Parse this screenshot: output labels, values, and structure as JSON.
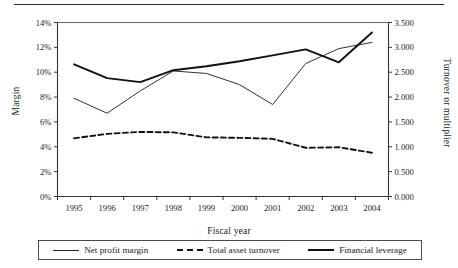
{
  "figure": {
    "top_rule": "horizontal-rule"
  },
  "chart_data": {
    "type": "line",
    "title": "",
    "xlabel": "Fiscal year",
    "ylabel": "Margin",
    "ylabel_secondary": "Turnover or multiplier",
    "categories": [
      "1995",
      "1996",
      "1997",
      "1998",
      "1999",
      "2000",
      "2001",
      "2002",
      "2003",
      "2004"
    ],
    "ylim": [
      0,
      14
    ],
    "yticks": [
      "0%",
      "2%",
      "4%",
      "6%",
      "8%",
      "10%",
      "12%",
      "14%"
    ],
    "ytick_values": [
      0,
      2,
      4,
      6,
      8,
      10,
      12,
      14
    ],
    "ylim_secondary": [
      0.0,
      3.5
    ],
    "yticks_secondary": [
      "0.000",
      "0.500",
      "1.000",
      "1.500",
      "2.000",
      "2.500",
      "3.000",
      "3.500"
    ],
    "ytick_values_secondary": [
      0.0,
      0.5,
      1.0,
      1.5,
      2.0,
      2.5,
      3.0,
      3.5
    ],
    "grid": false,
    "legend_position": "bottom",
    "series": [
      {
        "name": "Net profit margin",
        "axis": "left",
        "unit": "%",
        "style": "solid-thin",
        "values": [
          7.9,
          6.7,
          8.5,
          10.1,
          9.9,
          9.0,
          7.4,
          10.7,
          11.9,
          12.4
        ]
      },
      {
        "name": "Total asset turnover",
        "axis": "right",
        "unit": "x",
        "style": "dashed",
        "values": [
          1.17,
          1.26,
          1.3,
          1.29,
          1.19,
          1.18,
          1.16,
          0.98,
          0.99,
          0.88
        ]
      },
      {
        "name": "Financial leverage",
        "axis": "right",
        "unit": "x",
        "style": "solid-thick",
        "values": [
          2.66,
          2.38,
          2.3,
          2.54,
          2.62,
          2.72,
          2.84,
          2.96,
          2.7,
          3.3
        ]
      }
    ]
  },
  "legend": {
    "items": [
      {
        "label": "Net profit margin",
        "style": "solid-thin"
      },
      {
        "label": "Total asset turnover",
        "style": "dashed"
      },
      {
        "label": "Financial leverage",
        "style": "solid-thick"
      }
    ]
  }
}
